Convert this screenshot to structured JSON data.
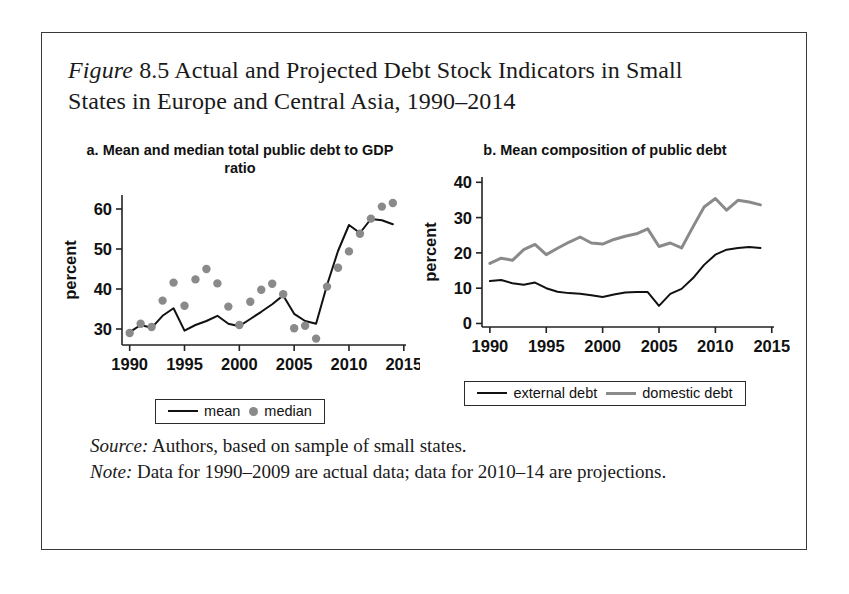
{
  "figure": {
    "label": "Figure",
    "number": "8.5",
    "title_rest": "Actual and Projected Debt Stock Indicators in Small States in Europe and Central Asia, 1990–2014",
    "source_label": "Source:",
    "source_text": " Authors, based on sample of small states.",
    "note_label": "Note:",
    "note_text": " Data for 1990–2009 are actual data; data for 2010–14 are projections."
  },
  "colors": {
    "line_black": "#111111",
    "line_gray": "#8a8a8a",
    "dot_gray": "#8a8a8a",
    "frame": "#3a3a3a"
  },
  "chart_data": [
    {
      "id": "panel-a",
      "type": "line",
      "title": "a. Mean and median total public debt to GDP ratio",
      "xlabel": "",
      "ylabel": "percent",
      "xlim": [
        1989.3,
        2015.2
      ],
      "ylim": [
        26.0,
        63.5
      ],
      "xticks": [
        1990,
        1995,
        2000,
        2005,
        2010,
        2015
      ],
      "xtick_labels": [
        "1990",
        "1995",
        "2000",
        "2005",
        "2010",
        "2015"
      ],
      "yticks": [
        30,
        40,
        50,
        60
      ],
      "ytick_labels": [
        "30",
        "40",
        "50",
        "60"
      ],
      "grid": false,
      "legend_position": "below",
      "x": [
        1990,
        1991,
        1992,
        1993,
        1994,
        1995,
        1996,
        1997,
        1998,
        1999,
        2000,
        2001,
        2002,
        2003,
        2004,
        2005,
        2006,
        2007,
        2008,
        2009,
        2010,
        2011,
        2012,
        2013,
        2014
      ],
      "series": [
        {
          "name": "mean",
          "style": "line",
          "color": "#111111",
          "values": [
            29.2,
            31.0,
            30.3,
            33.3,
            35.2,
            29.6,
            31.0,
            32.0,
            33.3,
            31.3,
            30.7,
            32.5,
            34.3,
            36.2,
            38.4,
            33.8,
            32.0,
            31.3,
            41.0,
            49.5,
            56.0,
            54.0,
            57.5,
            57.2,
            56.2
          ]
        },
        {
          "name": "median",
          "style": "scatter",
          "color": "#8a8a8a",
          "values": [
            29.0,
            31.3,
            30.5,
            37.1,
            41.6,
            35.8,
            42.4,
            45.0,
            41.4,
            35.6,
            31.0,
            36.8,
            39.8,
            41.3,
            38.7,
            30.2,
            30.8,
            27.6,
            40.6,
            45.3,
            49.4,
            53.8,
            57.6,
            60.6,
            61.5
          ]
        }
      ],
      "legend": [
        {
          "label": "mean",
          "marker": "line",
          "color": "#111111"
        },
        {
          "label": "median",
          "marker": "dot",
          "color": "#8a8a8a"
        }
      ]
    },
    {
      "id": "panel-b",
      "type": "line",
      "title": "b. Mean composition of public debt",
      "xlabel": "",
      "ylabel": "percent",
      "xlim": [
        1989.3,
        2015.2
      ],
      "ylim": [
        -1.0,
        41.5
      ],
      "xticks": [
        1990,
        1995,
        2000,
        2005,
        2010,
        2015
      ],
      "xtick_labels": [
        "1990",
        "1995",
        "2000",
        "2005",
        "2010",
        "2015"
      ],
      "yticks": [
        0,
        10,
        20,
        30,
        40
      ],
      "ytick_labels": [
        "0",
        "10",
        "20",
        "30",
        "40"
      ],
      "grid": false,
      "legend_position": "below",
      "x": [
        1990,
        1991,
        1992,
        1993,
        1994,
        1995,
        1996,
        1997,
        1998,
        1999,
        2000,
        2001,
        2002,
        2003,
        2004,
        2005,
        2006,
        2007,
        2008,
        2009,
        2010,
        2011,
        2012,
        2013,
        2014
      ],
      "series": [
        {
          "name": "external debt",
          "style": "line",
          "color": "#111111",
          "values": [
            12.0,
            12.3,
            11.4,
            11.0,
            11.6,
            10.0,
            9.0,
            8.6,
            8.4,
            8.0,
            7.5,
            8.2,
            8.8,
            8.9,
            8.9,
            5.0,
            8.4,
            9.8,
            12.8,
            16.6,
            19.5,
            20.9,
            21.4,
            21.7,
            21.4
          ]
        },
        {
          "name": "domestic debt",
          "style": "line",
          "color": "#8a8a8a",
          "values": [
            17.0,
            18.5,
            17.9,
            20.9,
            22.4,
            19.5,
            21.3,
            23.0,
            24.5,
            22.8,
            22.5,
            23.8,
            24.7,
            25.4,
            26.8,
            21.8,
            22.8,
            21.4,
            27.3,
            33.0,
            35.4,
            32.1,
            34.9,
            34.4,
            33.6
          ]
        }
      ],
      "legend": [
        {
          "label": "external debt",
          "marker": "line",
          "color": "#111111"
        },
        {
          "label": "domestic debt",
          "marker": "line",
          "color": "#8a8a8a"
        }
      ]
    }
  ]
}
